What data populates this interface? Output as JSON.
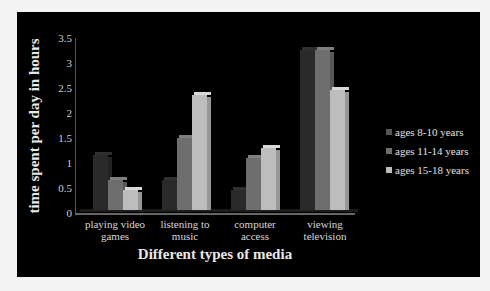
{
  "chart_data": {
    "type": "bar",
    "style": "3d-clustered-column",
    "title": "",
    "xlabel": "Different types of media",
    "ylabel": "time spent per day in hours",
    "ylim": [
      0,
      3.5
    ],
    "yticks": [
      "0",
      "0.5",
      "1",
      "1.5",
      "2",
      "2.5",
      "3",
      "3.5"
    ],
    "grid": false,
    "legend_position": "right",
    "categories": [
      "playing video games",
      "listening to music",
      "computer access",
      "viewing television"
    ],
    "category_lines": [
      [
        "playing video",
        "games"
      ],
      [
        "listening to",
        "music"
      ],
      [
        "computer",
        "access"
      ],
      [
        "viewing",
        "television"
      ]
    ],
    "series": [
      {
        "name": "ages 8-10 years",
        "color": "#2a2a2a",
        "values": [
          1.1,
          0.6,
          0.4,
          3.2
        ]
      },
      {
        "name": "ages 11-14 years",
        "color": "#6e6e6e",
        "values": [
          0.6,
          1.45,
          1.05,
          3.2
        ]
      },
      {
        "name": "ages 15-18 years",
        "color": "#bdbdbd",
        "values": [
          0.4,
          2.3,
          1.25,
          2.4
        ]
      }
    ]
  }
}
